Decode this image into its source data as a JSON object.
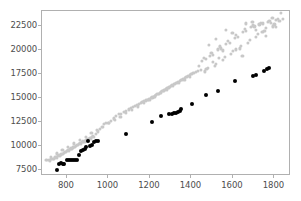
{
  "chart_data": {
    "type": "scatter",
    "title": "",
    "xlabel": "",
    "ylabel": "",
    "xlim": [
      680,
      1880
    ],
    "ylim": [
      6900,
      24100
    ],
    "grid": false,
    "legend": false,
    "xticks": [
      800,
      1000,
      1200,
      1400,
      1600,
      1800
    ],
    "xtick_labels": [
      "800",
      "1000",
      "1200",
      "1400",
      "1600",
      "1800"
    ],
    "yticks": [
      7500,
      10000,
      12500,
      15000,
      17500,
      20000,
      22500
    ],
    "ytick_labels": [
      "7500",
      "10000",
      "12500",
      "15000",
      "17500",
      "20000",
      "22500"
    ],
    "series": [
      {
        "name": "gray-series",
        "color": "#c8c8c8",
        "marker": "o",
        "marker_size": 3.2,
        "points": [
          [
            705,
            8540
          ],
          [
            712,
            8600
          ],
          [
            718,
            8500
          ],
          [
            724,
            8680
          ],
          [
            730,
            8720
          ],
          [
            736,
            8660
          ],
          [
            742,
            8840
          ],
          [
            748,
            8900
          ],
          [
            752,
            8820
          ],
          [
            757,
            9000
          ],
          [
            762,
            9080
          ],
          [
            766,
            9020
          ],
          [
            771,
            9160
          ],
          [
            776,
            9240
          ],
          [
            781,
            9200
          ],
          [
            786,
            9340
          ],
          [
            790,
            9420
          ],
          [
            795,
            9380
          ],
          [
            800,
            9520
          ],
          [
            805,
            9600
          ],
          [
            810,
            9560
          ],
          [
            815,
            9700
          ],
          [
            820,
            9780
          ],
          [
            824,
            9740
          ],
          [
            829,
            9880
          ],
          [
            834,
            9960
          ],
          [
            839,
            9920
          ],
          [
            844,
            10060
          ],
          [
            849,
            10140
          ],
          [
            854,
            10100
          ],
          [
            859,
            10240
          ],
          [
            864,
            10320
          ],
          [
            869,
            10280
          ],
          [
            874,
            10420
          ],
          [
            879,
            10500
          ],
          [
            884,
            10460
          ],
          [
            889,
            10600
          ],
          [
            894,
            10680
          ],
          [
            899,
            10640
          ],
          [
            904,
            10780
          ],
          [
            909,
            10860
          ],
          [
            915,
            10820
          ],
          [
            920,
            10960
          ],
          [
            926,
            11040
          ],
          [
            932,
            11000
          ],
          [
            940,
            11300
          ],
          [
            949,
            11550
          ],
          [
            958,
            11800
          ],
          [
            968,
            12050
          ],
          [
            978,
            12300
          ],
          [
            988,
            12400
          ],
          [
            1000,
            12420
          ],
          [
            1012,
            12650
          ],
          [
            1025,
            12900
          ],
          [
            1038,
            13150
          ],
          [
            1050,
            13400
          ],
          [
            1062,
            13380
          ],
          [
            1074,
            13560
          ],
          [
            1086,
            13700
          ],
          [
            1098,
            13840
          ],
          [
            1108,
            13960
          ],
          [
            1118,
            14080
          ],
          [
            1128,
            14200
          ],
          [
            1138,
            14320
          ],
          [
            1148,
            14440
          ],
          [
            1156,
            14540
          ],
          [
            1164,
            14620
          ],
          [
            1172,
            14700
          ],
          [
            1180,
            14780
          ],
          [
            1188,
            14860
          ],
          [
            1196,
            14940
          ],
          [
            1204,
            15020
          ],
          [
            1212,
            15100
          ],
          [
            1218,
            15180
          ],
          [
            1224,
            15260
          ],
          [
            1230,
            15340
          ],
          [
            1236,
            15420
          ],
          [
            1242,
            15500
          ],
          [
            1248,
            15580
          ],
          [
            1254,
            15660
          ],
          [
            1260,
            15740
          ],
          [
            1266,
            15820
          ],
          [
            1272,
            15900
          ],
          [
            1278,
            15980
          ],
          [
            1284,
            16060
          ],
          [
            1290,
            16140
          ],
          [
            1296,
            16220
          ],
          [
            1302,
            16300
          ],
          [
            1308,
            16380
          ],
          [
            1314,
            16460
          ],
          [
            1320,
            16540
          ],
          [
            1328,
            16640
          ],
          [
            1336,
            16740
          ],
          [
            1344,
            16840
          ],
          [
            1352,
            16940
          ],
          [
            1360,
            17040
          ],
          [
            1368,
            17140
          ],
          [
            1376,
            17240
          ],
          [
            1384,
            17340
          ],
          [
            1392,
            17440
          ],
          [
            1400,
            17540
          ],
          [
            1410,
            17640
          ],
          [
            1420,
            17740
          ],
          [
            1432,
            17860
          ],
          [
            1444,
            17980
          ],
          [
            1452,
            18900
          ],
          [
            1460,
            19200
          ],
          [
            1468,
            19100
          ],
          [
            1472,
            18100
          ],
          [
            1480,
            18200
          ],
          [
            1488,
            19400
          ],
          [
            1496,
            19700
          ],
          [
            1504,
            19500
          ],
          [
            1512,
            18400
          ],
          [
            1520,
            18600
          ],
          [
            1528,
            20100
          ],
          [
            1536,
            20400
          ],
          [
            1544,
            20200
          ],
          [
            1552,
            19000
          ],
          [
            1560,
            19300
          ],
          [
            1568,
            20700
          ],
          [
            1576,
            21000
          ],
          [
            1584,
            20800
          ],
          [
            1592,
            19600
          ],
          [
            1600,
            19900
          ],
          [
            1608,
            21300
          ],
          [
            1616,
            21600
          ],
          [
            1624,
            21400
          ],
          [
            1632,
            20200
          ],
          [
            1640,
            20500
          ],
          [
            1648,
            21900
          ],
          [
            1656,
            22200
          ],
          [
            1664,
            22000
          ],
          [
            1672,
            20800
          ],
          [
            1680,
            21100
          ],
          [
            1688,
            22400
          ],
          [
            1696,
            22600
          ],
          [
            1704,
            22500
          ],
          [
            1712,
            21400
          ],
          [
            1720,
            21700
          ],
          [
            1728,
            22700
          ],
          [
            1736,
            22900
          ],
          [
            1744,
            22800
          ],
          [
            1752,
            22000
          ],
          [
            1760,
            22300
          ],
          [
            1768,
            23000
          ],
          [
            1776,
            23100
          ],
          [
            1784,
            22900
          ],
          [
            1792,
            22500
          ],
          [
            1800,
            22700
          ],
          [
            1808,
            23200
          ],
          [
            1816,
            23300
          ],
          [
            1824,
            23100
          ],
          [
            1832,
            23900
          ],
          [
            1840,
            23300
          ],
          [
            1486,
            20600
          ],
          [
            1518,
            21200
          ],
          [
            1550,
            20000
          ],
          [
            1598,
            21800
          ],
          [
            1646,
            19400
          ],
          [
            1694,
            23000
          ],
          [
            1742,
            21900
          ],
          [
            1790,
            23400
          ],
          [
            1438,
            18400
          ],
          [
            1466,
            17800
          ],
          [
            1502,
            18800
          ],
          [
            1534,
            19200
          ],
          [
            1566,
            22100
          ],
          [
            1614,
            20100
          ],
          [
            1662,
            22800
          ],
          [
            1710,
            22100
          ],
          [
            1758,
            21500
          ],
          [
            1806,
            22400
          ],
          [
            1394,
            17200
          ],
          [
            1366,
            16900
          ],
          [
            1338,
            16600
          ],
          [
            1310,
            16250
          ],
          [
            1282,
            15900
          ],
          [
            1254,
            15550
          ],
          [
            1226,
            15200
          ],
          [
            1198,
            14850
          ],
          [
            1170,
            14500
          ],
          [
            1142,
            14150
          ],
          [
            1114,
            13800
          ],
          [
            1086,
            13450
          ],
          [
            1058,
            13100
          ],
          [
            1030,
            12750
          ],
          [
            1002,
            12400
          ],
          [
            974,
            12050
          ],
          [
            946,
            11700
          ],
          [
            918,
            11350
          ],
          [
            890,
            11000
          ],
          [
            862,
            10650
          ],
          [
            834,
            10300
          ],
          [
            806,
            9950
          ],
          [
            778,
            9600
          ],
          [
            750,
            9250
          ],
          [
            722,
            8900
          ],
          [
            700,
            8600
          ]
        ]
      },
      {
        "name": "black-series",
        "color": "#000000",
        "marker": "o",
        "marker_size": 4.0,
        "points": [
          [
            752,
            7560
          ],
          [
            762,
            8180
          ],
          [
            772,
            8220
          ],
          [
            780,
            8100
          ],
          [
            788,
            8160
          ],
          [
            800,
            8560
          ],
          [
            812,
            8580
          ],
          [
            822,
            8620
          ],
          [
            830,
            8520
          ],
          [
            840,
            8580
          ],
          [
            848,
            8620
          ],
          [
            858,
            9140
          ],
          [
            868,
            9480
          ],
          [
            876,
            9560
          ],
          [
            886,
            9760
          ],
          [
            894,
            9880
          ],
          [
            900,
            10560
          ],
          [
            910,
            10040
          ],
          [
            920,
            10100
          ],
          [
            930,
            10480
          ],
          [
            940,
            10500
          ],
          [
            950,
            10540
          ],
          [
            1086,
            11320
          ],
          [
            1208,
            12540
          ],
          [
            1252,
            13120
          ],
          [
            1292,
            13320
          ],
          [
            1306,
            13380
          ],
          [
            1316,
            13420
          ],
          [
            1324,
            13460
          ],
          [
            1334,
            13560
          ],
          [
            1344,
            13700
          ],
          [
            1352,
            13840
          ],
          [
            1404,
            14420
          ],
          [
            1468,
            15320
          ],
          [
            1530,
            15740
          ],
          [
            1610,
            16760
          ],
          [
            1698,
            17340
          ],
          [
            1712,
            17400
          ],
          [
            1752,
            17820
          ],
          [
            1766,
            18080
          ],
          [
            1776,
            18120
          ]
        ]
      }
    ]
  }
}
